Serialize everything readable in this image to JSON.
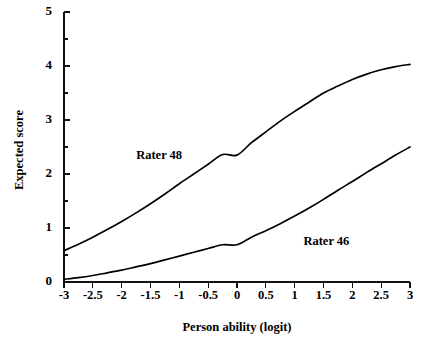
{
  "chart_data": {
    "type": "line",
    "title": "",
    "xlabel": "Person ability (logit)",
    "ylabel": "Expected score",
    "xlim": [
      -3,
      3
    ],
    "ylim": [
      0,
      5
    ],
    "grid": false,
    "legend_position": "inline-annotation",
    "x_tick_labels": [
      "-3",
      "-2.5",
      "-2",
      "-1.5",
      "-1",
      "-0.5",
      "0",
      "0.5",
      "1",
      "1.5",
      "2",
      "2.5",
      "3"
    ],
    "x_tick_values": [
      -3,
      -2.5,
      -2,
      -1.5,
      -1,
      -0.5,
      0,
      0.5,
      1,
      1.5,
      2,
      2.5,
      3
    ],
    "y_tick_labels": [
      "0",
      "1",
      "2",
      "3",
      "4",
      "5"
    ],
    "y_tick_values": [
      0,
      1,
      2,
      3,
      4,
      5
    ],
    "y_minor_tick_values": [
      0.5,
      1.5,
      2.5,
      3.5,
      4.5
    ],
    "x": [
      -3,
      -2.75,
      -2.5,
      -2.25,
      -2,
      -1.75,
      -1.5,
      -1.25,
      -1,
      -0.75,
      -0.5,
      -0.25,
      0,
      0.25,
      0.5,
      0.75,
      1,
      1.25,
      1.5,
      1.75,
      2,
      2.25,
      2.5,
      2.75,
      3
    ],
    "series": [
      {
        "name": "Rater 48",
        "label": "Rater 48",
        "label_x": -1.35,
        "label_y": 2.33,
        "color": "#000000",
        "values": [
          0.58,
          0.7,
          0.83,
          0.97,
          1.12,
          1.28,
          1.45,
          1.63,
          1.82,
          2.0,
          2.18,
          2.36,
          2.35,
          2.58,
          2.78,
          2.98,
          3.16,
          3.33,
          3.5,
          3.63,
          3.75,
          3.85,
          3.93,
          3.99,
          4.03
        ]
      },
      {
        "name": "Rater 46",
        "label": "Rater 46",
        "label_x": 1.55,
        "label_y": 0.73,
        "color": "#000000",
        "values": [
          0.05,
          0.08,
          0.12,
          0.17,
          0.22,
          0.28,
          0.34,
          0.41,
          0.48,
          0.55,
          0.62,
          0.69,
          0.69,
          0.83,
          0.95,
          1.08,
          1.22,
          1.37,
          1.53,
          1.7,
          1.86,
          2.03,
          2.19,
          2.35,
          2.5
        ]
      }
    ]
  },
  "geometry": {
    "plot_left": 64,
    "plot_right": 410,
    "plot_top": 12,
    "plot_bottom": 282,
    "xlabel_x": 237,
    "xlabel_y": 328,
    "ylabel_x": 20,
    "ylabel_y": 150,
    "xtick_label_y": 296,
    "ytick_label_x": 52,
    "major_tick_len": 6,
    "minor_tick_len": 4
  }
}
